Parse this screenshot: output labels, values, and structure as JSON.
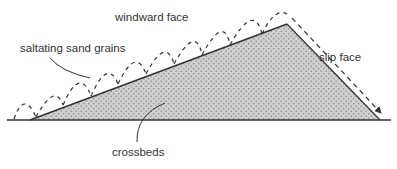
{
  "labels": {
    "windward_face": "windward face",
    "saltating_sand_grains": "saltating sand grains",
    "slip_face": "slip face",
    "crossbeds": "crossbeds"
  },
  "colors": {
    "ink": "#333333",
    "dune_fill": "#c8c8c8",
    "stipple": "#8a8a8a",
    "background": "#ffffff"
  }
}
